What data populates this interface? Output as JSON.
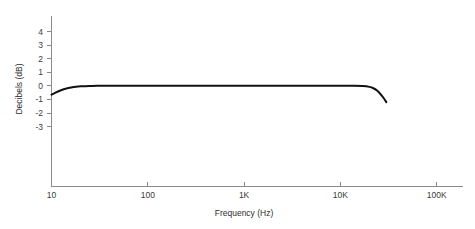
{
  "chart_data": {
    "type": "line",
    "title": "",
    "xlabel": "Frequency (Hz)",
    "ylabel": "Decibels (dB)",
    "xscale": "log",
    "xlim": [
      10,
      200000
    ],
    "ylim": [
      -6.5,
      5.5
    ],
    "grid": false,
    "legend": null,
    "x_tick_labels": [
      "10",
      "100",
      "1K",
      "10K",
      "100K"
    ],
    "x_tick_values": [
      10,
      100,
      1000,
      10000,
      100000
    ],
    "y_tick_labels": [
      "4",
      "3",
      "2",
      "1",
      "0",
      "-1",
      "-2",
      "-3"
    ],
    "y_tick_values": [
      4,
      3,
      2,
      1,
      0,
      -1,
      -2,
      -3
    ],
    "series": [
      {
        "name": "Frequency response",
        "x": [
          10,
          11,
          12,
          13,
          14,
          16,
          18,
          20,
          25,
          30,
          50,
          100,
          300,
          1000,
          3000,
          6000,
          10000,
          14000,
          17000,
          20000,
          22000,
          24000,
          26000,
          28000,
          30000
        ],
        "values": [
          -0.65,
          -0.5,
          -0.38,
          -0.29,
          -0.22,
          -0.13,
          -0.07,
          -0.04,
          -0.01,
          0.0,
          0.0,
          0.0,
          0.0,
          0.0,
          0.0,
          0.0,
          0.0,
          0.0,
          -0.02,
          -0.08,
          -0.18,
          -0.35,
          -0.6,
          -0.88,
          -1.2
        ]
      }
    ]
  },
  "axis": {
    "x_title": "Frequency (Hz)",
    "y_title": "Decibels (dB)"
  }
}
